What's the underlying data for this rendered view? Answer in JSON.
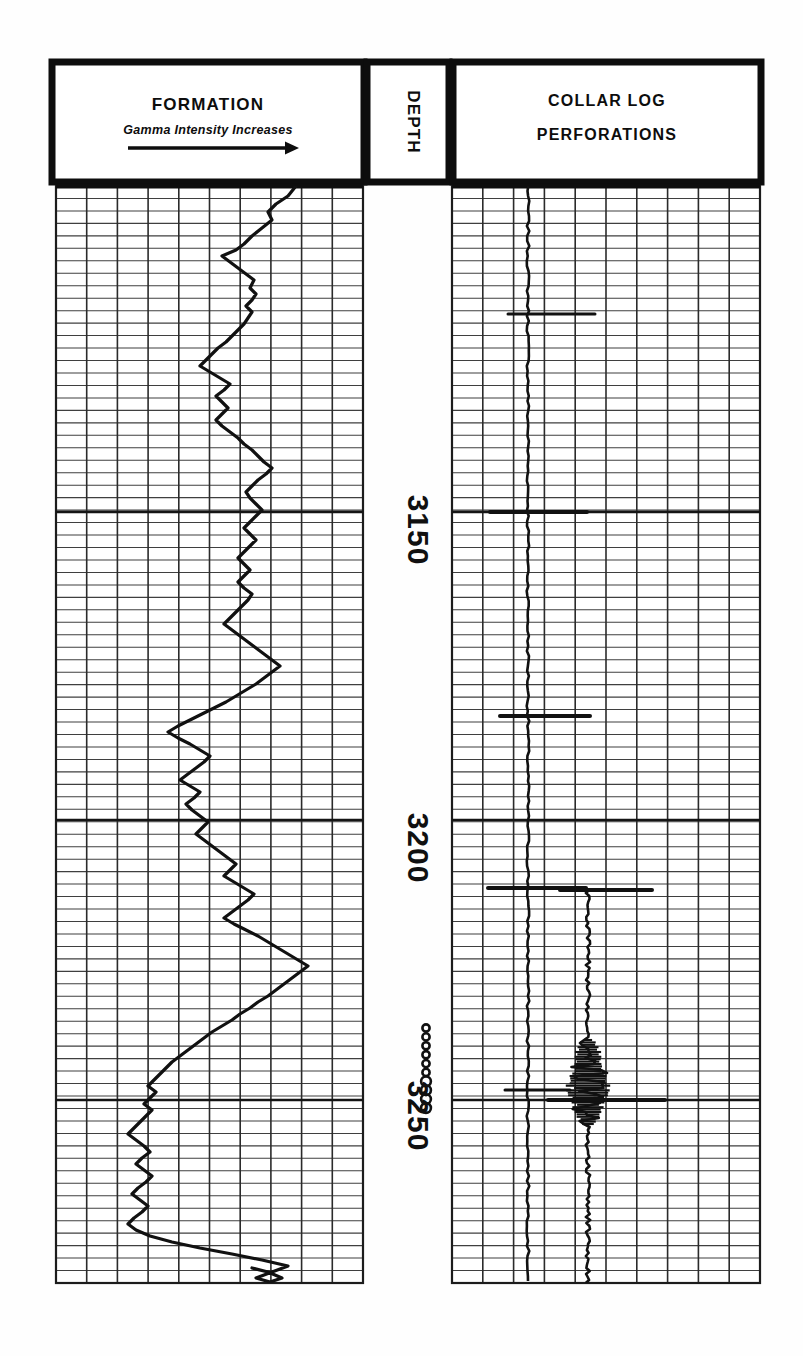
{
  "document": {
    "kind": "well-log-chart",
    "background_color": "#fefefe",
    "ink_color": "#101010",
    "grid_color": "#3a3a3a"
  },
  "tracks": {
    "formation": {
      "header_title": "FORMATION",
      "header_subtitle": "Gamma Intensity Increases",
      "arrow_icon": "right-arrow-icon",
      "box": {
        "x": 52,
        "y": 62,
        "w": 312,
        "h": 120
      },
      "grid": {
        "x": 56,
        "y": 186,
        "w": 307,
        "h": 1097,
        "cols": 10,
        "rows": 88
      }
    },
    "depth": {
      "header_title": "DEPTH",
      "box": {
        "x": 367,
        "y": 62,
        "w": 82,
        "h": 120
      },
      "labels": [
        {
          "text": "3150",
          "y": 530
        },
        {
          "text": "3200",
          "y": 848
        },
        {
          "text": "3250",
          "y": 1116
        }
      ],
      "major_lines_y": [
        512,
        820,
        1100
      ]
    },
    "collar": {
      "header_title": "COLLAR LOG",
      "header_subtitle": "PERFORATIONS",
      "box": {
        "x": 453,
        "y": 62,
        "w": 308,
        "h": 120
      },
      "grid": {
        "x": 452,
        "y": 186,
        "w": 308,
        "h": 1097,
        "cols": 10,
        "rows": 88
      }
    }
  },
  "chart_data": {
    "type": "line",
    "subtitle": "Gamma Intensity Increases",
    "xlabel": "Gamma Intensity (increases to the right)",
    "ylabel": "DEPTH (feet)",
    "ylim": [
      3103,
      3285
    ],
    "y_tick_labels": [
      "3150",
      "3200",
      "3250"
    ],
    "y_ticks": [
      3150,
      3200,
      3250
    ],
    "grid": true,
    "legend": "none",
    "orientation": "depth-vertical",
    "series": [
      {
        "name": "Gamma Ray (Formation)",
        "track": "formation",
        "units": "relative intensity",
        "x_range_px": [
          130,
          315
        ],
        "points_px": [
          [
            296,
            186
          ],
          [
            288,
            196
          ],
          [
            276,
            204
          ],
          [
            268,
            212
          ],
          [
            272,
            220
          ],
          [
            262,
            228
          ],
          [
            252,
            236
          ],
          [
            244,
            244
          ],
          [
            236,
            250
          ],
          [
            222,
            256
          ],
          [
            230,
            262
          ],
          [
            238,
            268
          ],
          [
            246,
            274
          ],
          [
            254,
            280
          ],
          [
            250,
            288
          ],
          [
            256,
            294
          ],
          [
            252,
            300
          ],
          [
            246,
            306
          ],
          [
            252,
            312
          ],
          [
            248,
            318
          ],
          [
            244,
            324
          ],
          [
            238,
            330
          ],
          [
            232,
            336
          ],
          [
            226,
            342
          ],
          [
            218,
            348
          ],
          [
            212,
            354
          ],
          [
            206,
            360
          ],
          [
            200,
            366
          ],
          [
            210,
            372
          ],
          [
            220,
            378
          ],
          [
            230,
            384
          ],
          [
            224,
            390
          ],
          [
            216,
            396
          ],
          [
            222,
            402
          ],
          [
            228,
            408
          ],
          [
            222,
            414
          ],
          [
            216,
            420
          ],
          [
            222,
            426
          ],
          [
            230,
            432
          ],
          [
            238,
            438
          ],
          [
            244,
            444
          ],
          [
            252,
            450
          ],
          [
            258,
            456
          ],
          [
            264,
            462
          ],
          [
            272,
            468
          ],
          [
            266,
            474
          ],
          [
            258,
            480
          ],
          [
            252,
            486
          ],
          [
            246,
            492
          ],
          [
            250,
            498
          ],
          [
            256,
            504
          ],
          [
            262,
            510
          ],
          [
            256,
            516
          ],
          [
            250,
            522
          ],
          [
            244,
            528
          ],
          [
            250,
            534
          ],
          [
            256,
            540
          ],
          [
            250,
            546
          ],
          [
            244,
            552
          ],
          [
            238,
            558
          ],
          [
            244,
            564
          ],
          [
            250,
            570
          ],
          [
            244,
            576
          ],
          [
            238,
            582
          ],
          [
            244,
            588
          ],
          [
            252,
            594
          ],
          [
            248,
            600
          ],
          [
            242,
            606
          ],
          [
            236,
            612
          ],
          [
            230,
            618
          ],
          [
            224,
            624
          ],
          [
            232,
            630
          ],
          [
            240,
            636
          ],
          [
            248,
            642
          ],
          [
            256,
            648
          ],
          [
            264,
            654
          ],
          [
            272,
            660
          ],
          [
            280,
            666
          ],
          [
            272,
            672
          ],
          [
            264,
            678
          ],
          [
            256,
            684
          ],
          [
            246,
            690
          ],
          [
            236,
            696
          ],
          [
            226,
            702
          ],
          [
            214,
            708
          ],
          [
            202,
            714
          ],
          [
            190,
            720
          ],
          [
            178,
            726
          ],
          [
            168,
            732
          ],
          [
            178,
            738
          ],
          [
            190,
            744
          ],
          [
            200,
            750
          ],
          [
            210,
            756
          ],
          [
            204,
            762
          ],
          [
            196,
            768
          ],
          [
            188,
            774
          ],
          [
            180,
            780
          ],
          [
            190,
            786
          ],
          [
            200,
            792
          ],
          [
            194,
            798
          ],
          [
            186,
            804
          ],
          [
            192,
            810
          ],
          [
            200,
            816
          ],
          [
            208,
            822
          ],
          [
            202,
            828
          ],
          [
            196,
            834
          ],
          [
            204,
            840
          ],
          [
            212,
            846
          ],
          [
            220,
            852
          ],
          [
            228,
            858
          ],
          [
            236,
            864
          ],
          [
            230,
            870
          ],
          [
            224,
            876
          ],
          [
            234,
            882
          ],
          [
            244,
            888
          ],
          [
            254,
            894
          ],
          [
            248,
            900
          ],
          [
            240,
            906
          ],
          [
            232,
            912
          ],
          [
            224,
            918
          ],
          [
            234,
            924
          ],
          [
            246,
            930
          ],
          [
            258,
            936
          ],
          [
            268,
            942
          ],
          [
            278,
            948
          ],
          [
            288,
            954
          ],
          [
            298,
            960
          ],
          [
            308,
            966
          ],
          [
            300,
            972
          ],
          [
            292,
            978
          ],
          [
            284,
            984
          ],
          [
            276,
            990
          ],
          [
            268,
            996
          ],
          [
            258,
            1002
          ],
          [
            250,
            1008
          ],
          [
            240,
            1014
          ],
          [
            232,
            1020
          ],
          [
            222,
            1026
          ],
          [
            212,
            1032
          ],
          [
            204,
            1038
          ],
          [
            196,
            1044
          ],
          [
            188,
            1050
          ],
          [
            180,
            1056
          ],
          [
            172,
            1062
          ],
          [
            166,
            1068
          ],
          [
            160,
            1074
          ],
          [
            154,
            1080
          ],
          [
            148,
            1086
          ],
          [
            156,
            1092
          ],
          [
            150,
            1098
          ],
          [
            144,
            1104
          ],
          [
            152,
            1110
          ],
          [
            146,
            1116
          ],
          [
            140,
            1122
          ],
          [
            134,
            1128
          ],
          [
            128,
            1134
          ],
          [
            136,
            1140
          ],
          [
            144,
            1146
          ],
          [
            150,
            1152
          ],
          [
            142,
            1158
          ],
          [
            136,
            1164
          ],
          [
            144,
            1170
          ],
          [
            152,
            1176
          ],
          [
            146,
            1182
          ],
          [
            138,
            1188
          ],
          [
            132,
            1194
          ],
          [
            140,
            1200
          ],
          [
            148,
            1206
          ],
          [
            142,
            1212
          ],
          [
            134,
            1218
          ],
          [
            128,
            1224
          ],
          [
            136,
            1230
          ],
          [
            150,
            1236
          ],
          [
            172,
            1242
          ],
          [
            200,
            1248
          ],
          [
            232,
            1254
          ],
          [
            262,
            1260
          ],
          [
            288,
            1266
          ],
          [
            272,
            1272
          ],
          [
            256,
            1278
          ],
          [
            270,
            1282
          ],
          [
            282,
            1278
          ],
          [
            268,
            1272
          ],
          [
            252,
            1268
          ]
        ]
      },
      {
        "name": "Collar Log (casing collars)",
        "track": "collar",
        "baseline_x_px": 528,
        "top_px": 186,
        "bottom_px": 1283,
        "collars_px": [
          {
            "y": 314,
            "x_left": 508,
            "x_right": 595,
            "weight": 3
          },
          {
            "y": 512,
            "x_left": 490,
            "x_right": 587,
            "weight": 4
          },
          {
            "y": 716,
            "x_left": 500,
            "x_right": 590,
            "weight": 4
          },
          {
            "y": 888,
            "x_left": 488,
            "x_right": 586,
            "weight": 4
          },
          {
            "y": 1090,
            "x_left": 505,
            "x_right": 570,
            "weight": 3
          }
        ]
      },
      {
        "name": "Perforation Log",
        "track": "collar",
        "baseline_x_px": 588,
        "top_px": 890,
        "bottom_px": 1283,
        "events_px": [
          {
            "y": 890,
            "x_left": 560,
            "x_right": 652,
            "weight": 4
          },
          {
            "y": 1100,
            "x_left": 548,
            "x_right": 665,
            "weight": 4
          }
        ],
        "noise_zone_px": {
          "y_start": 1040,
          "y_end": 1125,
          "amplitude": 22
        }
      }
    ],
    "perforation_markers": {
      "symbol": "circle",
      "x_px": 426,
      "count": 10,
      "y_start_px": 1028,
      "y_end_px": 1108,
      "note": "perforated interval markers in depth column"
    },
    "annotations": [
      {
        "text": "FORMATION",
        "role": "track-header"
      },
      {
        "text": "Gamma Intensity Increases",
        "role": "axis-direction"
      },
      {
        "text": "DEPTH",
        "role": "track-header"
      },
      {
        "text": "COLLAR LOG",
        "role": "track-header"
      },
      {
        "text": "PERFORATIONS",
        "role": "track-header"
      }
    ]
  }
}
